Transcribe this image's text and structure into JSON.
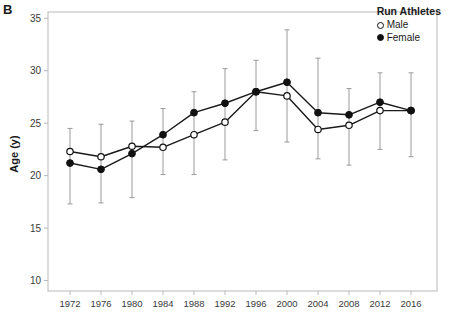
{
  "panel": {
    "letter": "B"
  },
  "legend": {
    "title": "Run Athletes",
    "entries": [
      {
        "label": "Male",
        "marker": "open-circle"
      },
      {
        "label": "Female",
        "marker": "filled-circle"
      }
    ]
  },
  "axes": {
    "ylabel": "Age (y)",
    "xlabel": "",
    "yticks": [
      10,
      15,
      20,
      25,
      30,
      35
    ],
    "ylim": [
      9.0,
      35.6
    ],
    "xticks": [
      "1972",
      "1976",
      "1980",
      "1984",
      "1988",
      "1992",
      "1996",
      "2000",
      "2004",
      "2008",
      "2012",
      "2016"
    ]
  },
  "colors": {
    "frame": "#b9b9b9",
    "line": "#1a1a1a",
    "errorbar": "#9a9a9a",
    "text": "#2b2b2b",
    "background": "#ffffff"
  },
  "chart_data": {
    "type": "line",
    "title": "",
    "xlabel": "",
    "ylabel": "Age (y)",
    "ylim": [
      9.0,
      35.6
    ],
    "grid": false,
    "legend_position": "top-right",
    "legend_title": "Run Athletes",
    "categories": [
      "1972",
      "1976",
      "1980",
      "1984",
      "1988",
      "1992",
      "1996",
      "2000",
      "2004",
      "2008",
      "2012",
      "2016"
    ],
    "series": [
      {
        "name": "Male",
        "marker": "open-circle",
        "values": [
          22.3,
          21.8,
          22.8,
          22.7,
          23.9,
          25.1,
          28.0,
          27.6,
          24.4,
          24.8,
          26.2,
          26.2
        ],
        "error_low": [
          19.9,
          19.2,
          19.9,
          20.1,
          20.1,
          21.5,
          24.3,
          23.2,
          21.6,
          21.0,
          22.5,
          21.8
        ],
        "error_high": [
          24.5,
          24.9,
          25.2,
          26.4,
          28.0,
          30.2,
          31.0,
          33.9,
          31.2,
          28.3,
          29.8,
          29.8
        ]
      },
      {
        "name": "Female",
        "marker": "filled-circle",
        "values": [
          21.2,
          20.6,
          22.1,
          23.9,
          26.0,
          26.9,
          28.0,
          28.9,
          26.0,
          25.8,
          27.0,
          26.2
        ],
        "error_low": [
          17.3,
          17.4,
          17.9,
          20.1,
          20.1,
          21.5,
          24.3,
          23.2,
          21.6,
          21.0,
          22.5,
          21.8
        ],
        "error_high": [
          24.5,
          24.9,
          25.2,
          26.4,
          28.0,
          30.2,
          31.0,
          33.9,
          31.2,
          28.3,
          29.8,
          29.8
        ]
      }
    ]
  }
}
